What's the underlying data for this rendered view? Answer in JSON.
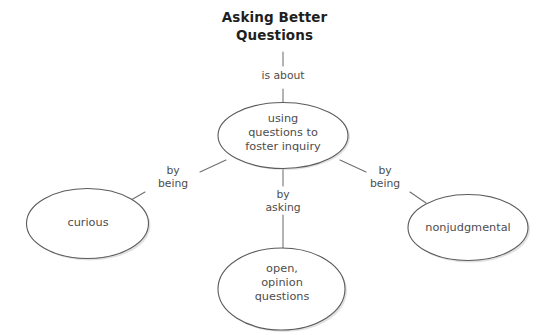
{
  "diagram": {
    "title": "Asking Better\nQuestions",
    "background_color": "#ffffff",
    "node_stroke_color": "#5b5b5b",
    "edge_stroke_color": "#6e6e6e",
    "title_color": "#1f1f1f",
    "text_color": "#4d4d4d",
    "nodes": [
      {
        "id": "center",
        "label": "using\nquestions to\nfoster inquiry"
      },
      {
        "id": "curious",
        "label": "curious"
      },
      {
        "id": "nonjudgmental",
        "label": "nonjudgmental"
      },
      {
        "id": "open_questions",
        "label": "open,\nopinion\nquestions"
      }
    ],
    "edges": [
      {
        "id": "title-to-center",
        "label": "is about",
        "from": "title",
        "to": "center"
      },
      {
        "id": "center-to-curious",
        "label": "by\nbeing",
        "from": "center",
        "to": "curious"
      },
      {
        "id": "center-to-nonjudgmental",
        "label": "by\nbeing",
        "from": "center",
        "to": "nonjudgmental"
      },
      {
        "id": "center-to-open",
        "label": "by\nasking",
        "from": "center",
        "to": "open_questions"
      }
    ]
  }
}
